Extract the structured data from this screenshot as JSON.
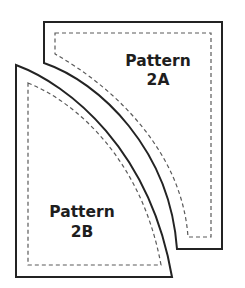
{
  "diagram": {
    "type": "sewing-pattern-pieces",
    "pieces": [
      {
        "id": "2A",
        "label_line1": "Pattern",
        "label_line2": "2A",
        "shape": "rectangle with concave curved lower-left edge",
        "has_seam_allowance_line": true
      },
      {
        "id": "2B",
        "label_line1": "Pattern",
        "label_line2": "2B",
        "shape": "quarter-circle with convex curved edge",
        "has_seam_allowance_line": true
      }
    ],
    "colors": {
      "outline": "#232323",
      "seam_line": "#5a5a5a",
      "background": "#ffffff",
      "text": "#1e1e1e"
    }
  }
}
